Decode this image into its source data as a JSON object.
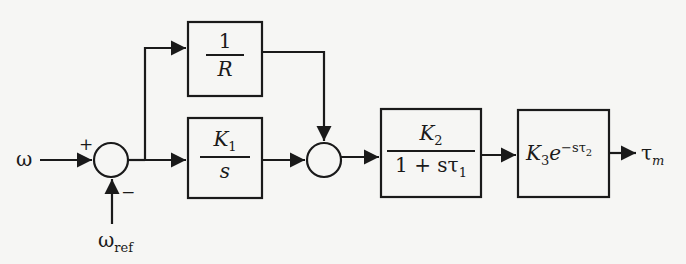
{
  "diagram": {
    "type": "block-diagram",
    "inputs": {
      "omega": "ω",
      "omega_ref_base": "ω",
      "omega_ref_sub": "ref"
    },
    "summing_junction_1": {
      "plus_sign": "+",
      "minus_sign": "−"
    },
    "blocks": {
      "droop": {
        "numerator": "1",
        "denominator": "R"
      },
      "integrator": {
        "numerator_base": "K",
        "numerator_sub": "1",
        "denominator": "s"
      },
      "lag": {
        "numerator_base": "K",
        "numerator_sub": "2",
        "denominator_prefix": "1 + s",
        "denominator_tau": "τ",
        "denominator_sub": "1"
      },
      "delay": {
        "gain_base": "K",
        "gain_sub": "3",
        "exp_base": "e",
        "exp_sup_prefix": "−s",
        "exp_sup_tau": "τ",
        "exp_sup_sub": "2"
      }
    },
    "output": {
      "base": "τ",
      "sub": "m"
    },
    "colors": {
      "line": "#1a1a1a",
      "background": "#f6f6f4"
    }
  }
}
